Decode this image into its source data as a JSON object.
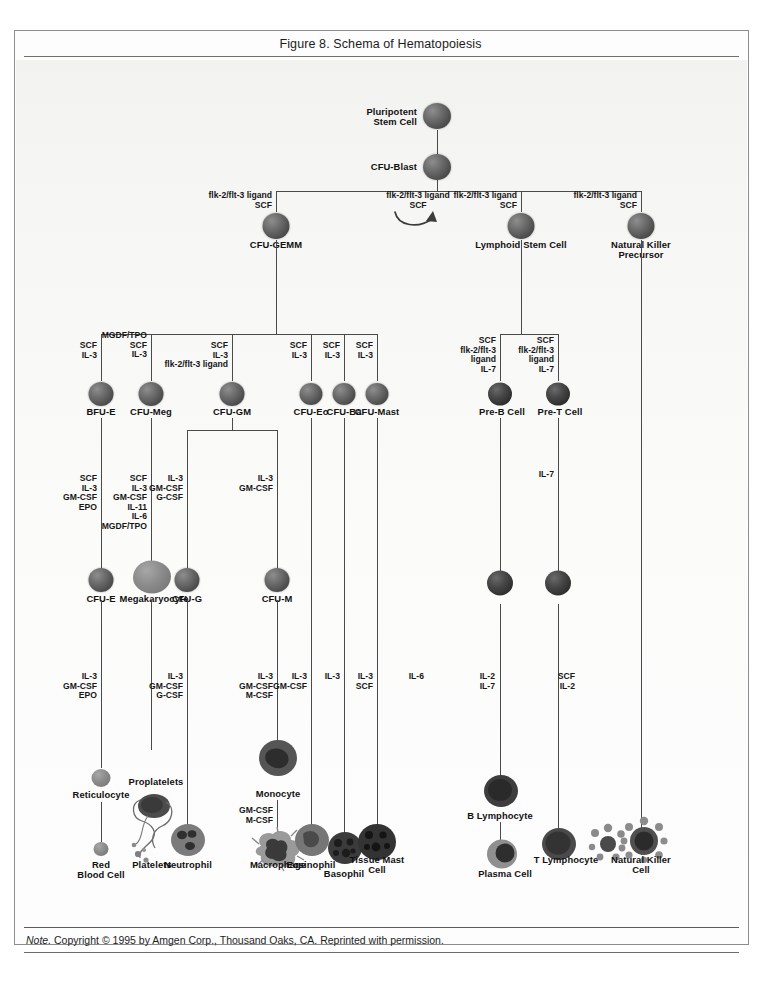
{
  "figure": {
    "title": "Figure 8. Schema of Hematopoiesis",
    "note_prefix": "Note.",
    "note_text": " Copyright © 1995 by Amgen Corp., Thousand Oaks, CA. Reprinted with permission."
  },
  "cells": {
    "pluripotent_stem_cell": "Pluripotent\nStem Cell",
    "cfu_blast": "CFU-Blast",
    "cfu_gemm": "CFU-GEMM",
    "lymphoid_stem_cell": "Lymphoid Stem Cell",
    "nk_precursor": "Natural Killer\nPrecursor",
    "bfu_e": "BFU-E",
    "cfu_meg": "CFU-Meg",
    "cfu_gm": "CFU-GM",
    "cfu_eo": "CFU-Eo",
    "cfu_ba": "CFU-Ba",
    "cfu_mast": "CFU-Mast",
    "pre_b_cell": "Pre-B Cell",
    "pre_t_cell": "Pre-T Cell",
    "cfu_e": "CFU-E",
    "megakaryocyte": "Megakaryocyte",
    "cfu_g": "CFU-G",
    "cfu_m": "CFU-M",
    "reticulocyte": "Reticulocyte",
    "proplatelets": "Proplatelets",
    "monocyte": "Monocyte",
    "red_blood_cell": "Red\nBlood Cell",
    "platelets": "Platelets",
    "neutrophil": "Neutrophil",
    "macrophage": "Macrophage",
    "eosinophil": "Eosinophil",
    "basophil": "Basophil",
    "tissue_mast_cell": "Tissue Mast\nCell",
    "b_lymphocyte": "B Lymphocyte",
    "plasma_cell": "Plasma Cell",
    "t_lymphocyte": "T Lymphocyte",
    "nk_cell": "Natural Killer\nCell"
  },
  "growth_factors": {
    "to_cfu_gemm": "flk-2/flt-3 ligand\nSCF",
    "self_renewal": "flk-2/flt-3 ligand\nSCF",
    "to_lymphoid": "flk-2/flt-3 ligand\nSCF",
    "to_nk_precursor": "flk-2/flt-3 ligand\nSCF",
    "to_bfu_e": "SCF\nIL-3",
    "to_cfu_meg": "MGDF/TPO\nSCF\nIL-3",
    "to_cfu_gm": "SCF\nIL-3\nflk-2/flt-3 ligand",
    "to_cfu_eo": "SCF\nIL-3",
    "to_cfu_ba": "SCF\nIL-3",
    "to_cfu_mast": "SCF\nIL-3",
    "to_pre_b": "SCF\nflk-2/flt-3\nligand\nIL-7",
    "to_pre_t": "SCF\nflk-2/flt-3\nligand\nIL-7",
    "to_cfu_e": "SCF\nIL-3\nGM-CSF\nEPO",
    "to_megakaryocyte": "SCF\nIL-3\nGM-CSF\nIL-11\nIL-6\nMGDF/TPO",
    "to_cfu_g": "IL-3\nGM-CSF\nG-CSF",
    "to_cfu_m": "IL-3\nGM-CSF",
    "to_b_inter": "IL-7",
    "to_reticulocyte": "IL-3\nGM-CSF\nEPO",
    "to_neutrophil": "IL-3\nGM-CSF\nG-CSF",
    "to_monocyte": "IL-3\nGM-CSF\nM-CSF",
    "to_eosinophil": "IL-3\nGM-CSF",
    "to_basophil": "IL-3",
    "to_tissue_mast": "IL-3\nSCF",
    "to_b_lymphocyte": "IL-6",
    "to_t_lymphocyte": "IL-2\nIL-7",
    "to_nk_cell": "SCF\nIL-2",
    "to_macrophage": "GM-CSF\nM-CSF"
  },
  "colors": {
    "line": "#4a4a4a",
    "text": "#171717",
    "frame": "#8d8d8d",
    "paper": "#f7f7f5"
  }
}
